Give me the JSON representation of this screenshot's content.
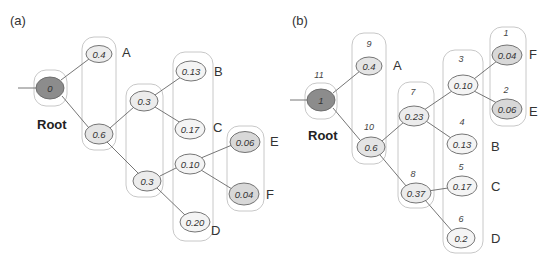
{
  "panels": {
    "a": {
      "label": "(a)",
      "root_label": "Root",
      "nodes": [
        {
          "id": "r",
          "value": "0",
          "kind": "root"
        },
        {
          "id": "n04",
          "value": "0.4",
          "kind": "leaf"
        },
        {
          "id": "n06",
          "value": "0.6",
          "kind": "internal"
        },
        {
          "id": "n03u",
          "value": "0.3",
          "kind": "internal"
        },
        {
          "id": "n03l",
          "value": "0.3",
          "kind": "internal"
        },
        {
          "id": "n013",
          "value": "0.13",
          "kind": "leaf"
        },
        {
          "id": "n017",
          "value": "0.17",
          "kind": "leaf"
        },
        {
          "id": "n010",
          "value": "0.10",
          "kind": "internal"
        },
        {
          "id": "n020",
          "value": "0.20",
          "kind": "leaf"
        },
        {
          "id": "n006",
          "value": "0.06",
          "kind": "leaf"
        },
        {
          "id": "n004",
          "value": "0.04",
          "kind": "leaf"
        }
      ],
      "leaf_labels": {
        "A": "A",
        "B": "B",
        "C": "C",
        "D": "D",
        "E": "E",
        "F": "F"
      }
    },
    "b": {
      "label": "(b)",
      "root_label": "Root",
      "nodes": [
        {
          "id": "r",
          "value": "1",
          "order": "11",
          "kind": "root"
        },
        {
          "id": "n04",
          "value": "0.4",
          "order": "9",
          "kind": "leaf"
        },
        {
          "id": "n06",
          "value": "0.6",
          "order": "10",
          "kind": "internal"
        },
        {
          "id": "n023",
          "value": "0.23",
          "order": "7",
          "kind": "internal"
        },
        {
          "id": "n037",
          "value": "0.37",
          "order": "8",
          "kind": "internal"
        },
        {
          "id": "n010",
          "value": "0.10",
          "order": "3",
          "kind": "internal"
        },
        {
          "id": "n013",
          "value": "0.13",
          "order": "4",
          "kind": "leaf"
        },
        {
          "id": "n017",
          "value": "0.17",
          "order": "5",
          "kind": "leaf"
        },
        {
          "id": "n02",
          "value": "0.2",
          "order": "6",
          "kind": "leaf"
        },
        {
          "id": "n004",
          "value": "0.04",
          "order": "1",
          "kind": "leaf"
        },
        {
          "id": "n006",
          "value": "0.06",
          "order": "2",
          "kind": "leaf"
        }
      ],
      "leaf_labels": {
        "A": "A",
        "B": "B",
        "C": "C",
        "D": "D",
        "E": "E",
        "F": "F"
      }
    }
  },
  "colors": {
    "root_fill": "#8c8c8c",
    "node_fill": "#ececec",
    "leaf_dark_fill": "#d8d8d8",
    "group_stroke": "#c8c8c8",
    "edge": "#666666"
  }
}
